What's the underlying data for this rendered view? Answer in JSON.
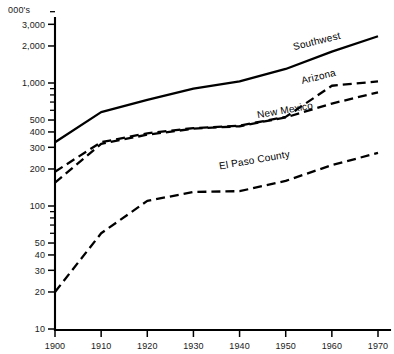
{
  "chart_data": {
    "type": "line",
    "title": "",
    "subtitle": "",
    "xlabel": "",
    "ylabel": "000's",
    "yscale": "log",
    "ylim": [
      10,
      3800
    ],
    "xlim": [
      1900,
      1970
    ],
    "grid": false,
    "legend_position": "inline-right-of-series",
    "x": [
      1900,
      1910,
      1920,
      1930,
      1940,
      1950,
      1960,
      1970
    ],
    "xticklabels": [
      "1900",
      "1910",
      "1920",
      "1930",
      "1940",
      "1950",
      "1960",
      "1970"
    ],
    "yticklabels": [
      "10",
      "20",
      "30",
      "40",
      "50",
      "100",
      "200",
      "300",
      "400",
      "500",
      "1,000",
      "2,000",
      "3,000"
    ],
    "ytickvalues": [
      10,
      20,
      30,
      40,
      50,
      100,
      200,
      300,
      400,
      500,
      1000,
      2000,
      3000
    ],
    "yminorticks": [
      60,
      70,
      80,
      90,
      600,
      700,
      800,
      900
    ],
    "series": [
      {
        "name": "Southwest",
        "style": "solid",
        "values": [
          330,
          580,
          730,
          900,
          1030,
          1300,
          1800,
          2400
        ],
        "label": "Southwest"
      },
      {
        "name": "Arizona",
        "style": "dashed",
        "values": [
          190,
          330,
          390,
          430,
          450,
          530,
          950,
          1030
        ],
        "label": "Arizona"
      },
      {
        "name": "New Mexico",
        "style": "dashed",
        "values": [
          155,
          320,
          380,
          425,
          445,
          525,
          680,
          840
        ],
        "label": "New Mexico"
      },
      {
        "name": "El Paso County",
        "style": "dashed",
        "values": [
          20,
          60,
          110,
          130,
          132,
          160,
          215,
          270
        ],
        "label": "El Paso County"
      }
    ],
    "annotations": [
      {
        "text": "Southwest",
        "x": 1962,
        "y": 2300,
        "rotation": -14
      },
      {
        "text": "Arizona",
        "x": 1961,
        "y": 1150,
        "rotation": -14
      },
      {
        "text": "New Mexico",
        "x": 1956,
        "y": 620,
        "rotation": -10
      },
      {
        "text": "El Paso County",
        "x": 1951,
        "y": 250,
        "rotation": -10
      }
    ]
  },
  "colors": {
    "line": "#000000",
    "axis": "#000000",
    "text": "#1a1a1a",
    "background": "#ffffff"
  }
}
